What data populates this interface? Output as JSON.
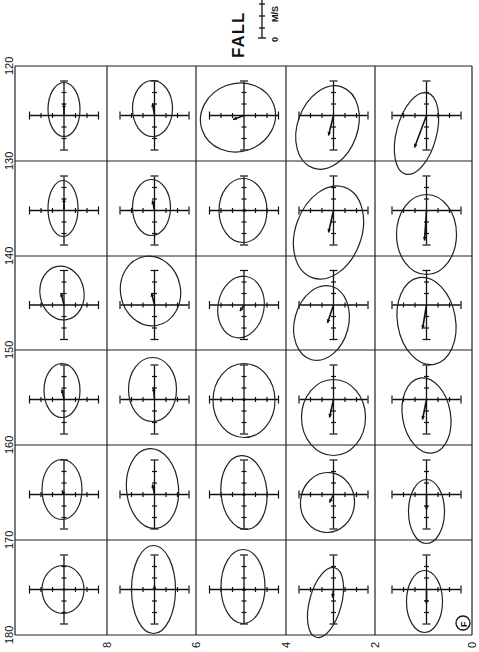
{
  "chart_data": {
    "type": "scatter",
    "subtype": "current-ellipse-grid",
    "title": "FALL",
    "panel_label": "F",
    "scale_bar": {
      "label": "M/S",
      "zero_label": "0"
    },
    "x_axis": {
      "ticks": [
        "8",
        "6",
        "4",
        "2",
        "0"
      ],
      "orientation": "rotated-90"
    },
    "y_axis": {
      "ticks": [
        "120",
        "130",
        "140",
        "150",
        "160",
        "170",
        "180"
      ],
      "orientation": "rotated-90"
    },
    "grid": {
      "x_bounds": [
        15,
        107,
        196,
        286,
        375,
        472
      ],
      "y_bounds": [
        66,
        161,
        256,
        350,
        445,
        540,
        635
      ]
    },
    "cells": [
      [
        {
          "rx": 16,
          "ry": 27,
          "rot": 0,
          "ex": 0,
          "ey": -6,
          "ax": 0,
          "ay": -12
        },
        {
          "rx": 20,
          "ry": 28,
          "rot": 0,
          "ex": -2,
          "ey": -7,
          "ax": -2,
          "ay": -12
        },
        {
          "rx": 38,
          "ry": 34,
          "rot": -20,
          "ex": -6,
          "ey": 2,
          "ax": -11,
          "ay": 4
        },
        {
          "rx": 30,
          "ry": 43,
          "rot": 20,
          "ex": -6,
          "ey": 12,
          "ax": -5,
          "ay": 20
        },
        {
          "rx": 20,
          "ry": 42,
          "rot": 15,
          "ex": -10,
          "ey": 18,
          "ax": -12,
          "ay": 32
        }
      ],
      [
        {
          "rx": 15,
          "ry": 28,
          "rot": 0,
          "ex": -1,
          "ey": -2,
          "ax": 0,
          "ay": -12
        },
        {
          "rx": 19,
          "ry": 28,
          "rot": 0,
          "ex": -3,
          "ey": -3,
          "ax": -2,
          "ay": -10
        },
        {
          "rx": 24,
          "ry": 32,
          "rot": 0,
          "ex": -1,
          "ey": 0,
          "ax": -2,
          "ay": 0
        },
        {
          "rx": 33,
          "ry": 48,
          "rot": 20,
          "ex": -5,
          "ey": 22,
          "ax": -5,
          "ay": 22
        },
        {
          "rx": 30,
          "ry": 40,
          "rot": 0,
          "ex": 0,
          "ey": 24,
          "ax": -2,
          "ay": 30
        }
      ],
      [
        {
          "rx": 22,
          "ry": 27,
          "rot": -10,
          "ex": -2,
          "ey": -12,
          "ax": -3,
          "ay": -12
        },
        {
          "rx": 30,
          "ry": 35,
          "rot": -10,
          "ex": -4,
          "ey": -14,
          "ax": -3,
          "ay": -12
        },
        {
          "rx": 23,
          "ry": 31,
          "rot": 10,
          "ex": -3,
          "ey": 2,
          "ax": -4,
          "ay": 6
        },
        {
          "rx": 27,
          "ry": 38,
          "rot": 15,
          "ex": -12,
          "ey": 18,
          "ax": -6,
          "ay": 18
        },
        {
          "rx": 29,
          "ry": 44,
          "rot": -10,
          "ex": 0,
          "ey": 16,
          "ax": -4,
          "ay": 24
        }
      ],
      [
        {
          "rx": 18,
          "ry": 27,
          "rot": 0,
          "ex": -2,
          "ey": -9,
          "ax": -2,
          "ay": -10
        },
        {
          "rx": 24,
          "ry": 32,
          "rot": 0,
          "ex": -2,
          "ey": -10,
          "ax": -1,
          "ay": -12
        },
        {
          "rx": 31,
          "ry": 37,
          "rot": 0,
          "ex": 0,
          "ey": 1,
          "ax": 0,
          "ay": 0
        },
        {
          "rx": 32,
          "ry": 38,
          "rot": 0,
          "ex": 0,
          "ey": 18,
          "ax": -4,
          "ay": 18
        },
        {
          "rx": 24,
          "ry": 38,
          "rot": -10,
          "ex": 0,
          "ey": 16,
          "ax": -4,
          "ay": 20
        }
      ],
      [
        {
          "rx": 20,
          "ry": 30,
          "rot": 0,
          "ex": -2,
          "ey": -5,
          "ax": -2,
          "ay": -4
        },
        {
          "rx": 26,
          "ry": 40,
          "rot": -5,
          "ex": -2,
          "ey": -6,
          "ax": -2,
          "ay": -10
        },
        {
          "rx": 23,
          "ry": 37,
          "rot": -5,
          "ex": 0,
          "ey": -2,
          "ax": 0,
          "ay": 0
        },
        {
          "rx": 27,
          "ry": 30,
          "rot": 5,
          "ex": -6,
          "ey": 8,
          "ax": -4,
          "ay": 8
        },
        {
          "rx": 18,
          "ry": 32,
          "rot": 0,
          "ex": 0,
          "ey": 17,
          "ax": 0,
          "ay": 15
        }
      ],
      [
        {
          "rx": 21,
          "ry": 24,
          "rot": 0,
          "ex": -1,
          "ey": 0,
          "ax": 0,
          "ay": 0
        },
        {
          "rx": 22,
          "ry": 44,
          "rot": 0,
          "ex": -1,
          "ey": 0,
          "ax": 0,
          "ay": -4
        },
        {
          "rx": 22,
          "ry": 37,
          "rot": 0,
          "ex": -1,
          "ey": -3,
          "ax": 0,
          "ay": -2
        },
        {
          "rx": 16,
          "ry": 36,
          "rot": 15,
          "ex": -8,
          "ey": 13,
          "ax": -1,
          "ay": 8
        },
        {
          "rx": 18,
          "ry": 31,
          "rot": 0,
          "ex": -2,
          "ey": 12,
          "ax": 0,
          "ay": 14
        }
      ]
    ]
  }
}
